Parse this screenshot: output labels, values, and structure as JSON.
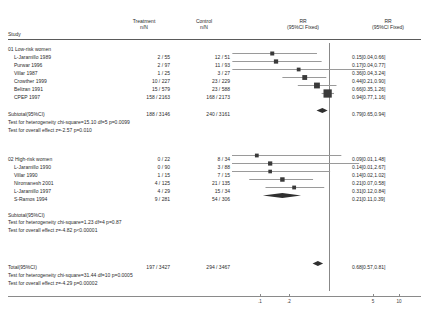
{
  "header": {
    "study": "Study",
    "treatment_l1": "Treatment",
    "treatment_l2": "n/N",
    "control_l1": "Control",
    "control_l2": "n/N",
    "rr_plot_l1": "RR",
    "rr_plot_l2": "(95%CI Fixed)",
    "rr_text_l1": "RR",
    "rr_text_l2": "(95%CI Fixed)"
  },
  "groups": [
    {
      "id": "01",
      "label": "01 Low-risk women",
      "rows": [
        {
          "study": "L-Jaramillo 1989",
          "treatment": "2 / 55",
          "control": "12 / 51",
          "rr": "0.15[0.04,0.66]"
        },
        {
          "study": "Purwar 1996",
          "treatment": "2 / 97",
          "control": "11 / 93",
          "rr": "0.17[0.04,0.77]"
        },
        {
          "study": "Villar 1987",
          "treatment": "1 / 25",
          "control": "3 / 27",
          "rr": "0.36[0.04,3.24]"
        },
        {
          "study": "Crowther 1999",
          "treatment": "10 / 227",
          "control": "23 / 229",
          "rr": "0.44[0.21,0.90]"
        },
        {
          "study": "Belizan 1991",
          "treatment": "15 / 579",
          "control": "23 / 588",
          "rr": "0.66[0.35,1.26]"
        },
        {
          "study": "CPEP 1997",
          "treatment": "158 / 2163",
          "control": "168 / 2173",
          "rr": "0.94[0.77,1.16]"
        }
      ],
      "subtotal": {
        "study": "Subtotal(95%CI)",
        "treatment": "188 / 3146",
        "control": "240 / 3161",
        "rr": "0.79[0.65,0.94]"
      },
      "heterogeneity": "Test for heterogeneity chi-square=15.10 df=5 p=0.0099",
      "overall_effect": "Test for overall effect z=-2.57 p=0.010"
    },
    {
      "id": "02",
      "label": "02 High-risk women",
      "label_treatment": "0 / 22",
      "label_control": "8 / 34",
      "label_rr": "0.09[0.01,1.48]",
      "rows": [
        {
          "study": "L-Jaramillo 1990",
          "treatment": "0 / 90",
          "control": "3 / 88",
          "rr": "0.14[0.01,2.67]"
        },
        {
          "study": "Villar 1990",
          "treatment": "1 / 15",
          "control": "7 / 15",
          "rr": "0.14[0.02,1.02]"
        },
        {
          "study": "Niromanesh 2001",
          "treatment": "4 / 125",
          "control": "21 / 135",
          "rr": "0.21[0.07,0.58]"
        },
        {
          "study": "L-Jaramillo 1997",
          "treatment": "4 / 29",
          "control": "15 / 34",
          "rr": "0.31[0.12,0.84]"
        },
        {
          "study": "S-Ramos 1994",
          "treatment": "9 / 281",
          "control": "54 / 306",
          "rr": "0.21[0.11,0.39]"
        }
      ],
      "subtotal": {
        "study": "Subtotal(95%CI)",
        "treatment": "",
        "control": "",
        "rr": ""
      },
      "heterogeneity": "Test for heterogeneity chi-square=1.23 df=4 p=0.87",
      "overall_effect": "Test for overall effect z=-4.82 p<0.00001"
    }
  ],
  "total": {
    "study": "Total(95%CI)",
    "treatment": "197 / 3427",
    "control": "294 / 3467",
    "rr": "0.68[0.57,0.81]",
    "heterogeneity": "Test for heterogeneity chi-square=31.44 df=10 p=0.0005",
    "overall_effect": "Test for overall effect  z=-4.29 p=0.00002"
  },
  "axis": {
    "ticks": [
      ".1",
      ".2",
      "5",
      "10"
    ],
    "tick_x": [
      260,
      289,
      373,
      399
    ],
    "center_x": 334
  },
  "chart_data": {
    "type": "forest",
    "title": "",
    "xlabel": "",
    "ylabel": "",
    "effect_measure": "RR",
    "ci_level": "95%CI Fixed",
    "scale": "log",
    "axis_ticks": [
      0.1,
      0.2,
      5,
      10
    ],
    "null_value": 1,
    "studies": [
      {
        "name": "L-Jaramillo 1989",
        "group": "01 Low-risk women",
        "rr": 0.15,
        "ci_low": 0.04,
        "ci_high": 0.66,
        "treatment_n": 2,
        "treatment_N": 55,
        "control_n": 12,
        "control_N": 51,
        "marker": "square"
      },
      {
        "name": "Purwar 1996",
        "group": "01 Low-risk women",
        "rr": 0.17,
        "ci_low": 0.04,
        "ci_high": 0.77,
        "treatment_n": 2,
        "treatment_N": 97,
        "control_n": 11,
        "control_N": 93,
        "marker": "square"
      },
      {
        "name": "Villar 1987",
        "group": "01 Low-risk women",
        "rr": 0.36,
        "ci_low": 0.04,
        "ci_high": 3.24,
        "treatment_n": 1,
        "treatment_N": 25,
        "control_n": 3,
        "control_N": 27,
        "marker": "square"
      },
      {
        "name": "Crowther 1999",
        "group": "01 Low-risk women",
        "rr": 0.44,
        "ci_low": 0.21,
        "ci_high": 0.9,
        "treatment_n": 10,
        "treatment_N": 227,
        "control_n": 23,
        "control_N": 229,
        "marker": "square"
      },
      {
        "name": "Belizan 1991",
        "group": "01 Low-risk women",
        "rr": 0.66,
        "ci_low": 0.35,
        "ci_high": 1.26,
        "treatment_n": 15,
        "treatment_N": 579,
        "control_n": 23,
        "control_N": 588,
        "marker": "square"
      },
      {
        "name": "CPEP 1997",
        "group": "01 Low-risk women",
        "rr": 0.94,
        "ci_low": 0.77,
        "ci_high": 1.16,
        "treatment_n": 158,
        "treatment_N": 2163,
        "control_n": 168,
        "control_N": 2173,
        "marker": "square"
      },
      {
        "name": "Subtotal(95%CI)",
        "group": "01 Low-risk women",
        "rr": 0.79,
        "ci_low": 0.65,
        "ci_high": 0.94,
        "treatment_n": 188,
        "treatment_N": 3146,
        "control_n": 240,
        "control_N": 3161,
        "marker": "diamond"
      },
      {
        "name": "02 High-risk women",
        "group": "02 High-risk women",
        "rr": 0.09,
        "ci_low": 0.01,
        "ci_high": 1.48,
        "treatment_n": 0,
        "treatment_N": 22,
        "control_n": 8,
        "control_N": 34,
        "marker": "square"
      },
      {
        "name": "L-Jaramillo 1990",
        "group": "02 High-risk women",
        "rr": 0.14,
        "ci_low": 0.01,
        "ci_high": 2.67,
        "treatment_n": 0,
        "treatment_N": 90,
        "control_n": 3,
        "control_N": 88,
        "marker": "square"
      },
      {
        "name": "Villar 1990",
        "group": "02 High-risk women",
        "rr": 0.14,
        "ci_low": 0.02,
        "ci_high": 1.02,
        "treatment_n": 1,
        "treatment_N": 15,
        "control_n": 7,
        "control_N": 15,
        "marker": "square"
      },
      {
        "name": "Niromanesh 2001",
        "group": "02 High-risk women",
        "rr": 0.21,
        "ci_low": 0.07,
        "ci_high": 0.58,
        "treatment_n": 4,
        "treatment_N": 125,
        "control_n": 21,
        "control_N": 135,
        "marker": "square"
      },
      {
        "name": "L-Jaramillo 1997",
        "group": "02 High-risk women",
        "rr": 0.31,
        "ci_low": 0.12,
        "ci_high": 0.84,
        "treatment_n": 4,
        "treatment_N": 29,
        "control_n": 15,
        "control_N": 34,
        "marker": "square"
      },
      {
        "name": "S-Ramos 1994",
        "group": "02 High-risk women",
        "rr": 0.21,
        "ci_low": 0.11,
        "ci_high": 0.39,
        "treatment_n": 9,
        "treatment_N": 281,
        "control_n": 54,
        "control_N": 306,
        "marker": "diamond"
      },
      {
        "name": "Total(95%CI)",
        "group": "Total",
        "rr": 0.68,
        "ci_low": 0.57,
        "ci_high": 0.81,
        "treatment_n": 197,
        "treatment_N": 3427,
        "control_n": 294,
        "control_N": 3467,
        "marker": "diamond"
      }
    ]
  },
  "layout": {
    "row_y": [
      54,
      62,
      70,
      78,
      86,
      94,
      111,
      156,
      164,
      172,
      180,
      188,
      196,
      264
    ],
    "group_label_y": [
      46,
      156
    ],
    "note_y": [
      119,
      127,
      219,
      227,
      272,
      280
    ],
    "subtotal2_y": 212
  },
  "colors": {
    "text": "#2b2b2b",
    "rule": "#5a5a5a",
    "marker": "#3a3a3a",
    "ci_line": "#9a9a9a",
    "axis": "#8a8a8a",
    "center_line": "#6a6a6a"
  }
}
